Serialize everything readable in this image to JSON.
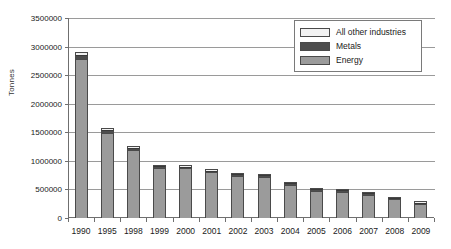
{
  "chart_data": {
    "type": "bar",
    "subtype": "stacked-column",
    "title": "",
    "xlabel": "",
    "ylabel": "Tonnes",
    "ylim": [
      0,
      3500000
    ],
    "ytick_step": 500000,
    "yticks": [
      "3500000",
      "3000000",
      "2500000",
      "2000000",
      "1500000",
      "1000000",
      "500000",
      "0"
    ],
    "grid": true,
    "legend_position": "top-right",
    "categories": [
      "1990",
      "1995",
      "1998",
      "1999",
      "2000",
      "2001",
      "2002",
      "2003",
      "2004",
      "2005",
      "2006",
      "2007",
      "2008",
      "2009"
    ],
    "series": [
      {
        "name": "Energy",
        "color": "#9b9b9b",
        "values": [
          2790000,
          1490000,
          1190000,
          880000,
          870000,
          800000,
          740000,
          720000,
          580000,
          470000,
          460000,
          400000,
          330000,
          250000
        ]
      },
      {
        "name": "Metals",
        "color": "#4d4d4d",
        "values": [
          60000,
          50000,
          40000,
          30000,
          30000,
          30000,
          30000,
          30000,
          30000,
          30000,
          30000,
          30000,
          25000,
          20000
        ]
      },
      {
        "name": "All other industries",
        "color": "#f2f2f2",
        "values": [
          50000,
          30000,
          30000,
          20000,
          20000,
          20000,
          20000,
          20000,
          20000,
          20000,
          20000,
          20000,
          15000,
          10000
        ]
      }
    ],
    "totals": [
      2900000,
      1570000,
      1260000,
      930000,
      920000,
      850000,
      790000,
      770000,
      630000,
      520000,
      510000,
      450000,
      370000,
      280000
    ]
  },
  "legend": {
    "items": [
      {
        "label": "All other industries",
        "swatch": "#f2f2f2"
      },
      {
        "label": "Metals",
        "swatch": "#4d4d4d"
      },
      {
        "label": "Energy",
        "swatch": "#9b9b9b"
      }
    ]
  },
  "axis": {
    "y_title": "Tonnes"
  }
}
